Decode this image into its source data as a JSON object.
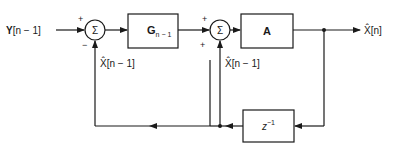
{
  "diagram": {
    "type": "block-diagram",
    "colors": {
      "stroke": "#1a1a1a",
      "background": "#ffffff"
    },
    "input": {
      "label_prefix": "Y",
      "label_suffix": "[n − 1]"
    },
    "output": {
      "label": "X̂[n]"
    },
    "summing_junctions": [
      {
        "id": "sum1",
        "symbol": "Σ",
        "sign_top": "+",
        "sign_bottom": "−",
        "feedback_label": "X̂[n − 1]"
      },
      {
        "id": "sum2",
        "symbol": "Σ",
        "sign_top": "+",
        "sign_bottom": "+",
        "feedback_label": "X̂[n − 1]"
      }
    ],
    "blocks": [
      {
        "id": "gain-g",
        "label_main": "G",
        "label_sub": "n − 1"
      },
      {
        "id": "gain-a",
        "label_main": "A"
      },
      {
        "id": "delay",
        "label_main": "z",
        "label_sup": "−1"
      }
    ]
  }
}
